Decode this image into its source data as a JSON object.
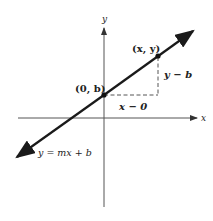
{
  "diagram": {
    "axes": {
      "x_label": "x",
      "y_label": "y"
    },
    "points": {
      "intercept": "(0, b)",
      "general": "(x, y)"
    },
    "segments": {
      "rise": "y − b",
      "run": "x − 0"
    },
    "equation": "y = mx + b",
    "colors": {
      "line": "#1a1a1a",
      "axis": "#555555",
      "dashed": "#555555"
    }
  }
}
